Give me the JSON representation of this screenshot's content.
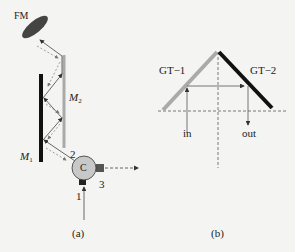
{
  "panel_a": {
    "caption": "(a)",
    "labels": {
      "fm": "FM",
      "m1_main": "M",
      "m1_sub": "1",
      "m2_main": "M",
      "m2_sub": "2",
      "circulator": "C",
      "port1": "1",
      "port2": "2",
      "port3": "3"
    },
    "colors": {
      "fm": "#444444",
      "m1": "#111111",
      "m2": "#aaaaaa",
      "circulator_fill": "#c8c8c8",
      "port": "#222222"
    }
  },
  "panel_b": {
    "caption": "(b)",
    "labels": {
      "gt1": "GT−1",
      "gt2": "GT−2",
      "in": "in",
      "out": "out"
    },
    "colors": {
      "gt1": "#aaaaaa",
      "gt2": "#111111"
    }
  }
}
